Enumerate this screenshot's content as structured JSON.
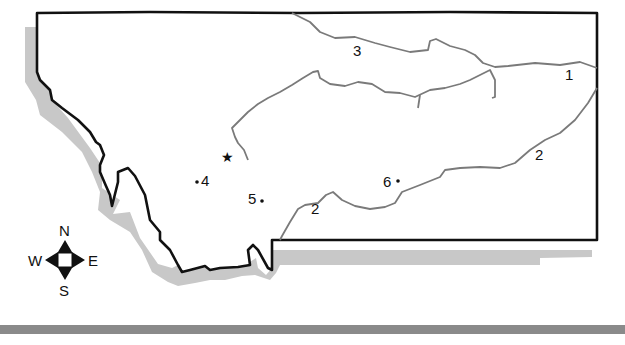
{
  "map": {
    "subject": "Montana state outline with rivers",
    "colors": {
      "border": "#111111",
      "river": "#7a7a7a",
      "shadow": "#c8c8c8",
      "frame": "#8a8a8a",
      "background": "#ffffff"
    },
    "labels": [
      {
        "id": "label-1",
        "text": "1",
        "x": 570,
        "y": 80
      },
      {
        "id": "label-2-east",
        "text": "2",
        "x": 538,
        "y": 158
      },
      {
        "id": "label-3",
        "text": "3",
        "x": 352,
        "y": 55
      },
      {
        "id": "label-4",
        "text": "4",
        "x": 203,
        "y": 185
      },
      {
        "id": "label-5",
        "text": "5",
        "x": 249,
        "y": 203
      },
      {
        "id": "label-6",
        "text": "6",
        "x": 384,
        "y": 186
      },
      {
        "id": "label-2-south",
        "text": "2",
        "x": 312,
        "y": 213
      }
    ],
    "points": [
      {
        "id": "point-4",
        "x": 197,
        "y": 182
      },
      {
        "id": "point-5",
        "x": 262,
        "y": 201
      },
      {
        "id": "point-6",
        "x": 398,
        "y": 181
      }
    ],
    "capital_star": {
      "symbol": "★",
      "x": 228,
      "y": 158
    }
  },
  "compass": {
    "north": "N",
    "south": "S",
    "east": "E",
    "west": "W"
  }
}
